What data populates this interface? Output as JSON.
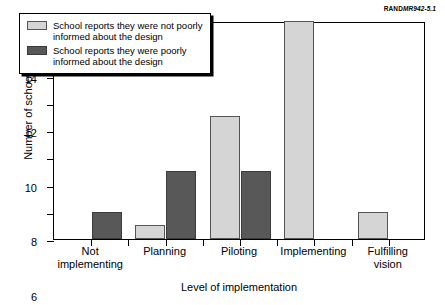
{
  "source_tag": {
    "org": "RAND",
    "reference": "MR942-5.1"
  },
  "legend": {
    "position": "inside-top-left",
    "entries": [
      {
        "swatch": "light-gray-swatch",
        "label": "School reports they were not poorly\ninformed about the design"
      },
      {
        "swatch": "dark-gray-swatch",
        "label": "School reports they were poorly\ninformed about the design"
      }
    ]
  },
  "chart_data": {
    "type": "bar",
    "title": "",
    "xlabel": "Level of implementation",
    "ylabel": "Number of schools",
    "categories": [
      "Not\nimplementing",
      "Planning",
      "Piloting",
      "Implementing",
      "Fulfilling\nvision"
    ],
    "series": [
      {
        "name": "School reports they were not poorly informed about the design",
        "color": "#d5d5d5",
        "values": [
          0,
          1,
          9,
          16,
          2
        ]
      },
      {
        "name": "School reports they were poorly informed about the design",
        "color": "#585858",
        "values": [
          2,
          5,
          5,
          0,
          0
        ]
      }
    ],
    "ylim": [
      0,
      16
    ],
    "yticks": [
      0,
      2,
      4,
      6,
      8,
      10,
      12,
      14,
      16
    ],
    "ytick_labels": [
      "0",
      "2",
      "4",
      "6",
      "8",
      "10",
      "12",
      "14",
      "16"
    ],
    "grid": false,
    "legend_position": "upper left"
  }
}
